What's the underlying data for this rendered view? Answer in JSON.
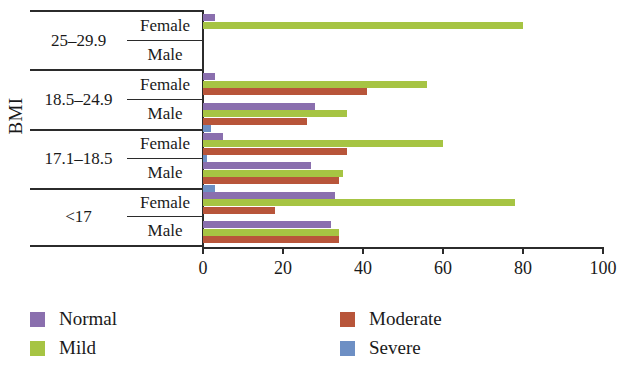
{
  "chart_data": {
    "type": "bar",
    "orientation": "horizontal",
    "title": "",
    "xlabel": "",
    "ylabel": "BMI",
    "xlim": [
      0,
      100
    ],
    "xticks": [
      0,
      20,
      40,
      60,
      80,
      100
    ],
    "grid": false,
    "legend_position": "bottom",
    "categories": [
      "25–29.9 / Female",
      "25–29.9 / Male",
      "18.5–24.9 / Female",
      "18.5–24.9 / Male",
      "17.1–18.5 / Female",
      "17.1–18.5 / Male",
      "<17 / Female",
      "<17 / Male"
    ],
    "groups": [
      {
        "bmi": "25–29.9",
        "rows": [
          {
            "sex": "Female",
            "values": {
              "Normal": 3,
              "Mild": 80,
              "Moderate": 0,
              "Severe": 0
            }
          },
          {
            "sex": "Male",
            "values": {
              "Normal": 0,
              "Mild": 0,
              "Moderate": 0,
              "Severe": 0
            }
          }
        ]
      },
      {
        "bmi": "18.5–24.9",
        "rows": [
          {
            "sex": "Female",
            "values": {
              "Normal": 3,
              "Mild": 56,
              "Moderate": 41,
              "Severe": 0
            }
          },
          {
            "sex": "Male",
            "values": {
              "Normal": 28,
              "Mild": 36,
              "Moderate": 26,
              "Severe": 2
            }
          }
        ]
      },
      {
        "bmi": "17.1–18.5",
        "rows": [
          {
            "sex": "Female",
            "values": {
              "Normal": 5,
              "Mild": 60,
              "Moderate": 36,
              "Severe": 1
            }
          },
          {
            "sex": "Male",
            "values": {
              "Normal": 27,
              "Mild": 35,
              "Moderate": 34,
              "Severe": 3
            }
          }
        ]
      },
      {
        "bmi": "<17",
        "rows": [
          {
            "sex": "Female",
            "values": {
              "Normal": 33,
              "Mild": 78,
              "Moderate": 18,
              "Severe": 0
            }
          },
          {
            "sex": "Male",
            "values": {
              "Normal": 32,
              "Mild": 34,
              "Moderate": 34,
              "Severe": 0
            }
          }
        ]
      }
    ],
    "series": [
      {
        "name": "Normal",
        "color": "#8a6fae",
        "values": [
          3,
          0,
          3,
          28,
          5,
          27,
          33,
          32
        ]
      },
      {
        "name": "Mild",
        "color": "#a6c443",
        "values": [
          80,
          0,
          56,
          36,
          60,
          35,
          78,
          34
        ]
      },
      {
        "name": "Moderate",
        "color": "#b8553a",
        "values": [
          0,
          0,
          41,
          26,
          36,
          34,
          18,
          34
        ]
      },
      {
        "name": "Severe",
        "color": "#6d8fc4",
        "values": [
          0,
          0,
          0,
          2,
          1,
          3,
          0,
          0
        ]
      }
    ],
    "legend": [
      {
        "label": "Normal",
        "color": "#8a6fae"
      },
      {
        "label": "Moderate",
        "color": "#b8553a"
      },
      {
        "label": "Mild",
        "color": "#a6c443"
      },
      {
        "label": "Severe",
        "color": "#6d8fc4"
      }
    ]
  },
  "axis": {
    "y_title": "BMI",
    "x_tick_labels": [
      "0",
      "20",
      "40",
      "60",
      "80",
      "100"
    ]
  },
  "labels": {
    "female": "Female",
    "male": "Male",
    "bmi_groups": [
      "25–29.9",
      "18.5–24.9",
      "17.1–18.5",
      "<17"
    ]
  }
}
